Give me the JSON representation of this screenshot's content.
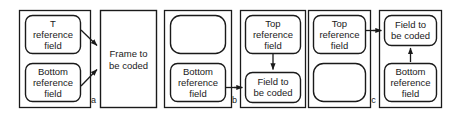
{
  "figure": {
    "background_color": "#ffffff",
    "line_color": "#1a1a1a",
    "width": 461,
    "height": 120
  },
  "labels": {
    "top_reference_field": "Top reference field",
    "bottom_reference_field": "Bottom reference field",
    "frame_to_be_coded": "Frame to be coded",
    "field_to_be_coded": "Field to be coded",
    "empty": ""
  },
  "panels": [
    {
      "id": "a",
      "letter": "a",
      "description": "Frame picture predicted from both top and bottom reference fields",
      "boxes": [
        {
          "name": "top-reference-field-box",
          "label": "Top reference field",
          "shape": "rounded"
        },
        {
          "name": "bottom-reference-field-box",
          "label": "Bottom reference field",
          "shape": "rounded"
        },
        {
          "name": "frame-to-be-coded-box",
          "label": "Frame to be coded",
          "shape": "rectangle"
        }
      ],
      "arrows": [
        {
          "from": "top-reference-field-box",
          "to": "frame-to-be-coded-box",
          "direction": "diagonal-down-right"
        },
        {
          "from": "bottom-reference-field-box",
          "to": "frame-to-be-coded-box",
          "direction": "diagonal-up-right"
        }
      ]
    },
    {
      "id": "b",
      "letter": "b",
      "description": "Top field coded from bottom reference field; bottom field coded from top field",
      "boxes": [
        {
          "name": "empty-reference-box",
          "label": "",
          "shape": "rounded"
        },
        {
          "name": "bottom-reference-field-box",
          "label": "Bottom reference field",
          "shape": "rounded"
        },
        {
          "name": "top-reference-field-box",
          "label": "Top reference field",
          "shape": "rounded"
        },
        {
          "name": "field-to-be-coded-box",
          "label": "Field to be coded",
          "shape": "rounded"
        }
      ],
      "arrows": [
        {
          "from": "bottom-reference-field-box",
          "to": "field-to-be-coded-box",
          "direction": "horizontal-right"
        },
        {
          "from": "top-reference-field-box",
          "to": "field-to-be-coded-box",
          "direction": "vertical-down"
        }
      ]
    },
    {
      "id": "c",
      "letter": "c",
      "description": "Top field coded from top reference field; bottom field coded from bottom reference field",
      "boxes": [
        {
          "name": "top-reference-field-box",
          "label": "Top reference field",
          "shape": "rounded"
        },
        {
          "name": "empty-reference-box",
          "label": "",
          "shape": "rounded"
        },
        {
          "name": "field-to-be-coded-box",
          "label": "Field to be coded",
          "shape": "rounded"
        },
        {
          "name": "bottom-reference-field-box",
          "label": "Bottom reference field",
          "shape": "rounded"
        }
      ],
      "arrows": [
        {
          "from": "top-reference-field-box",
          "to": "field-to-be-coded-box",
          "direction": "horizontal-right"
        },
        {
          "from": "bottom-reference-field-box",
          "to": "field-to-be-coded-box",
          "direction": "vertical-up"
        }
      ]
    }
  ]
}
